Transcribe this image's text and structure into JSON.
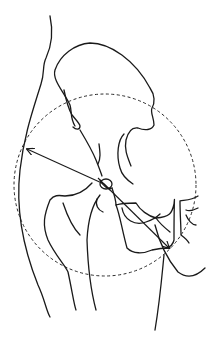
{
  "diagram": {
    "stroke_color": "#1a1a1a",
    "background": "#ffffff",
    "circle": {
      "cx": 105,
      "cy": 185,
      "r": 91
    },
    "center": {
      "x": 104,
      "y": 184
    },
    "arrows": [
      {
        "name": "radius-arrow-left",
        "x1": 104,
        "y1": 184,
        "x2": 27,
        "y2": 149
      },
      {
        "name": "radius-arrow-lower-right",
        "x1": 104,
        "y1": 184,
        "x2": 169,
        "y2": 248
      }
    ]
  }
}
